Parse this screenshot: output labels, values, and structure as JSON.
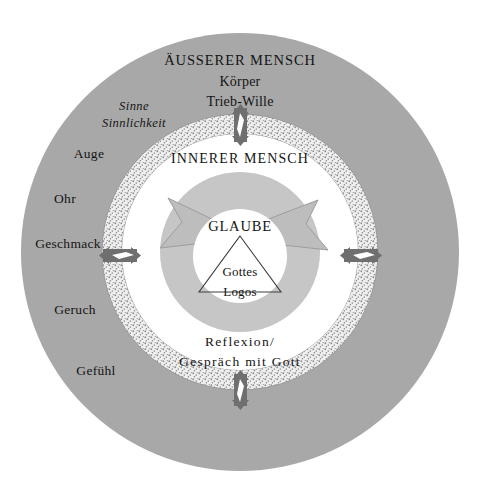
{
  "figure": {
    "kind": "concentric-circle-diagram",
    "background_color": "#ffffff"
  },
  "colors": {
    "outer_ring_fill": "#a8a8a8",
    "stipple_ring_fill": "#ededed",
    "stipple_dot": "#8e8e8e",
    "mid_white_fill": "#ffffff",
    "inner_annulus_fill": "#c6c6c6",
    "core_fill": "#ffffff",
    "arrow_fill": "#bdbdbd",
    "arrow_stroke": "#8a8a8a",
    "marker_fill": "#6f6f6f",
    "text_color": "#141414",
    "triangle_stroke": "#3c3c3c"
  },
  "outer_zone": {
    "heading": "ÄUSSERER MENSCH",
    "line2": "Körper",
    "line3": "Trieb-Wille",
    "italic_line1": "Sinne",
    "italic_line2": "Sinnlichkeit",
    "senses": [
      {
        "label": "Auge"
      },
      {
        "label": "Ohr"
      },
      {
        "label": "Geschmack"
      },
      {
        "label": "Geruch"
      },
      {
        "label": "Gefühl"
      }
    ]
  },
  "inner_zone": {
    "heading": "INNERER MENSCH",
    "reflexion_line1": "Reflexion/",
    "reflexion_line2": "Gespräch mit Gott"
  },
  "core": {
    "faith_label": "GLAUBE",
    "triangle_line1": "Gottes",
    "triangle_line2": "Logos"
  },
  "markers": {
    "top_arrow": "bidirectional-arrow-vertical",
    "bottom_arrow": "bidirectional-arrow-vertical",
    "left_arrow": "bidirectional-arrow-horizontal",
    "right_arrow": "bidirectional-arrow-horizontal",
    "circulation_left": "large-arrowhead-left",
    "circulation_right": "large-arrowhead-right"
  }
}
